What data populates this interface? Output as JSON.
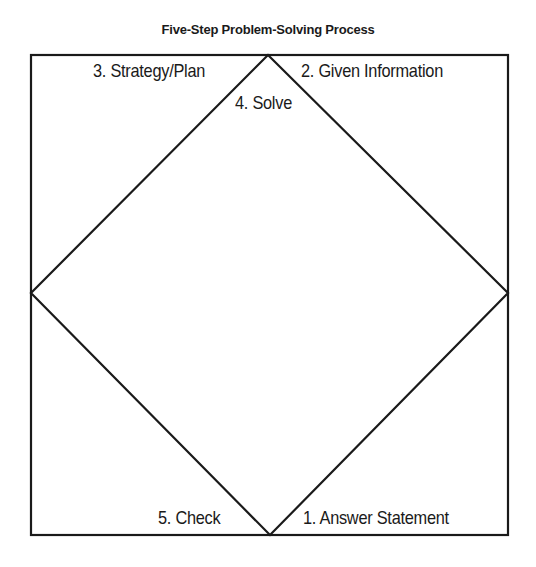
{
  "title": "Five-Step Problem-Solving Process",
  "steps": [
    {
      "number": 1,
      "label": "1. Answer Statement",
      "region": "bottom-right"
    },
    {
      "number": 2,
      "label": "2. Given Information",
      "region": "top-right"
    },
    {
      "number": 3,
      "label": "3. Strategy/Plan",
      "region": "top-left"
    },
    {
      "number": 4,
      "label": "4. Solve",
      "region": "center-diamond"
    },
    {
      "number": 5,
      "label": "5. Check",
      "region": "bottom-left"
    }
  ],
  "colors": {
    "line": "#1a1a1a",
    "background": "#ffffff"
  }
}
